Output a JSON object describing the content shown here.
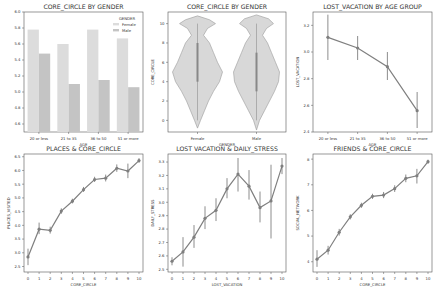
{
  "figure": {
    "width": 436,
    "height": 287,
    "background": "#ffffff"
  },
  "colors": {
    "female_bar": "#dcdcdc",
    "male_bar": "#c4c4c4",
    "violin_fill": "#d8d8d8",
    "violin_edge": "#9a9a9a",
    "line": "#7f7f7f",
    "errorbar": "#6f6f6f",
    "axes": "#555555",
    "text": "#333333"
  },
  "chart_data": [
    {
      "id": "core_circle_by_gender_bar",
      "type": "bar",
      "title": "CORE_CIRCLE BY GENDER",
      "xlabel": "AGE",
      "ylabel": "",
      "categories": [
        "20 or less",
        "21 to 35",
        "36 to 50",
        "51 or more"
      ],
      "series": [
        {
          "name": "Female",
          "values": [
            5.78,
            5.6,
            5.78,
            5.67
          ]
        },
        {
          "name": "Male",
          "values": [
            5.48,
            5.1,
            5.15,
            5.06
          ]
        }
      ],
      "legend": {
        "title": "GENDER",
        "position": "upper right",
        "entries": [
          "Female",
          "Male"
        ]
      },
      "ylim": [
        4.5,
        6.0
      ],
      "yticks": [
        4.6,
        4.8,
        5.0,
        5.2,
        5.4,
        5.6,
        5.8,
        6.0
      ],
      "grid": false
    },
    {
      "id": "core_circle_by_gender_violin",
      "type": "violin",
      "title": "CORE_CIRCLE BY GENDER",
      "xlabel": "GENDER",
      "ylabel": "CORE_CIRCLE",
      "categories": [
        "Female",
        "Male"
      ],
      "ylim": [
        -1.2,
        11.2
      ],
      "yticks": [
        0,
        2,
        4,
        6,
        8,
        10
      ],
      "series": [
        {
          "name": "Female",
          "min": -0.8,
          "max": 10.8,
          "median": 6,
          "q1": 4,
          "q3": 8
        },
        {
          "name": "Male",
          "min": -1.0,
          "max": 10.9,
          "median": 5,
          "q1": 3,
          "q3": 7
        }
      ],
      "grid": false
    },
    {
      "id": "lost_vacation_by_age_group",
      "type": "line",
      "title": "LOST_VACATION BY AGE GROUP",
      "xlabel": "AGE",
      "ylabel": "LOST_VACATION",
      "categories": [
        "20 or less",
        "21 to 35",
        "36 to 50",
        "51 or more"
      ],
      "values": [
        3.11,
        3.03,
        2.89,
        2.56
      ],
      "error_low": [
        2.94,
        2.94,
        2.79,
        2.43
      ],
      "error_high": [
        3.28,
        3.12,
        3.0,
        2.7
      ],
      "ylim": [
        2.4,
        3.3
      ],
      "yticks": [
        2.4,
        2.6,
        2.8,
        3.0,
        3.2
      ],
      "grid": false
    },
    {
      "id": "places_and_core_circle",
      "type": "line",
      "title": "PLACES & CORE_CIRCLE",
      "xlabel": "CORE_CIRCLE",
      "ylabel": "PLACES_VISITED",
      "x": [
        0,
        1,
        2,
        3,
        4,
        5,
        6,
        7,
        8,
        9,
        10
      ],
      "values": [
        2.85,
        3.86,
        3.82,
        4.52,
        4.88,
        5.3,
        5.67,
        5.72,
        6.08,
        5.98,
        6.36
      ],
      "error_low": [
        2.55,
        3.68,
        3.7,
        4.42,
        4.8,
        5.22,
        5.58,
        5.6,
        5.95,
        5.72,
        6.28
      ],
      "error_high": [
        3.15,
        4.1,
        3.95,
        4.62,
        4.97,
        5.4,
        5.77,
        5.85,
        6.22,
        6.25,
        6.45
      ],
      "ylim": [
        2.3,
        6.6
      ],
      "yticks": [
        2.5,
        3.0,
        3.5,
        4.0,
        4.5,
        5.0,
        5.5,
        6.0,
        6.5
      ],
      "xticks": [
        0,
        1,
        2,
        3,
        4,
        5,
        6,
        7,
        8,
        9,
        10
      ],
      "grid": false
    },
    {
      "id": "lost_vacation_and_daily_stress",
      "type": "line",
      "title": "LOST VACATION & DAILY_STRESS",
      "xlabel": "LOST_VACATION",
      "ylabel": "DAILY_STRESS",
      "x": [
        0,
        1,
        2,
        3,
        4,
        5,
        6,
        7,
        8,
        9,
        10
      ],
      "values": [
        2.56,
        2.63,
        2.74,
        2.88,
        2.94,
        3.1,
        3.21,
        3.12,
        2.96,
        3.01,
        3.27
      ],
      "error_low": [
        2.53,
        2.52,
        2.66,
        2.8,
        2.86,
        3.03,
        3.08,
        3.02,
        2.85,
        2.73,
        3.21
      ],
      "error_high": [
        2.59,
        2.74,
        2.83,
        2.97,
        3.03,
        3.18,
        3.33,
        3.24,
        3.08,
        3.28,
        3.33
      ],
      "ylim": [
        2.48,
        3.36
      ],
      "yticks": [
        2.5,
        2.6,
        2.7,
        2.8,
        2.9,
        3.0,
        3.1,
        3.2,
        3.3
      ],
      "xticks": [
        0,
        1,
        2,
        3,
        4,
        5,
        6,
        7,
        8,
        9,
        10
      ],
      "grid": false
    },
    {
      "id": "friends_and_core_circle",
      "type": "line",
      "title": "FRIENDS & CORE_CIRCLE",
      "xlabel": "CORE_CIRCLE",
      "ylabel": "SOCIAL_NETWORK",
      "x": [
        0,
        1,
        2,
        3,
        4,
        5,
        6,
        7,
        8,
        9,
        10
      ],
      "values": [
        4.1,
        4.45,
        5.15,
        5.75,
        6.2,
        6.55,
        6.6,
        6.85,
        7.25,
        7.35,
        7.9
      ],
      "error_low": [
        3.8,
        4.28,
        5.02,
        5.65,
        6.1,
        6.45,
        6.48,
        6.72,
        7.1,
        7.05,
        7.82
      ],
      "error_high": [
        4.45,
        4.62,
        5.28,
        5.85,
        6.3,
        6.65,
        6.72,
        6.98,
        7.4,
        7.62,
        7.98
      ],
      "ylim": [
        3.6,
        8.2
      ],
      "yticks": [
        4,
        5,
        6,
        7,
        8
      ],
      "xticks": [
        0,
        1,
        2,
        3,
        4,
        5,
        6,
        7,
        8,
        9,
        10
      ],
      "grid": false
    }
  ]
}
